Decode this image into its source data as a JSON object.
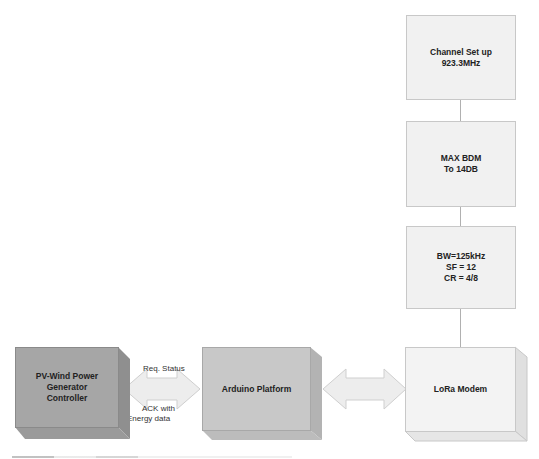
{
  "diagram": {
    "config_boxes": [
      {
        "id": "channel",
        "lines": [
          "Channel Set up",
          "923.3MHz"
        ]
      },
      {
        "id": "bdm",
        "lines": [
          "MAX BDM",
          "To 14DB"
        ]
      },
      {
        "id": "radio",
        "lines": [
          "BW=125kHz",
          "SF = 12",
          "CR = 4/8"
        ]
      }
    ],
    "blocks": [
      {
        "id": "controller",
        "label_lines": [
          "PV-Wind Power Generator",
          "Controller"
        ],
        "color": "#a6a6a6"
      },
      {
        "id": "arduino",
        "label_lines": [
          "Arduino Platform"
        ],
        "color": "#c8c8c8"
      },
      {
        "id": "lora",
        "label_lines": [
          "LoRa Modem"
        ],
        "color": "#f3f3f3"
      }
    ],
    "arrows": [
      {
        "from": "controller",
        "to": "arduino",
        "label_top": "Req. Status",
        "label_bottom_lines": [
          "ACK with",
          "Energy data"
        ]
      },
      {
        "from": "arduino",
        "to": "lora"
      }
    ],
    "colors": {
      "config_fill": "#f1f1f1",
      "arrow_fill": "#ededed",
      "connector": "#b0b0b0"
    }
  }
}
